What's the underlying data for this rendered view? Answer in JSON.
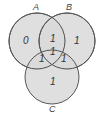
{
  "diagram": {
    "type": "venn-3",
    "colors": {
      "fill": "#d9d9d9",
      "stroke": "#555555",
      "text": "#333333"
    },
    "sets": [
      {
        "name": "A",
        "label": "A"
      },
      {
        "name": "B",
        "label": "B"
      },
      {
        "name": "C",
        "label": "C"
      }
    ],
    "regions": {
      "a_only": "0",
      "b_only": "1",
      "c_only": "1",
      "ab": "1",
      "ac": "1",
      "bc": "1",
      "abc": "1"
    }
  }
}
